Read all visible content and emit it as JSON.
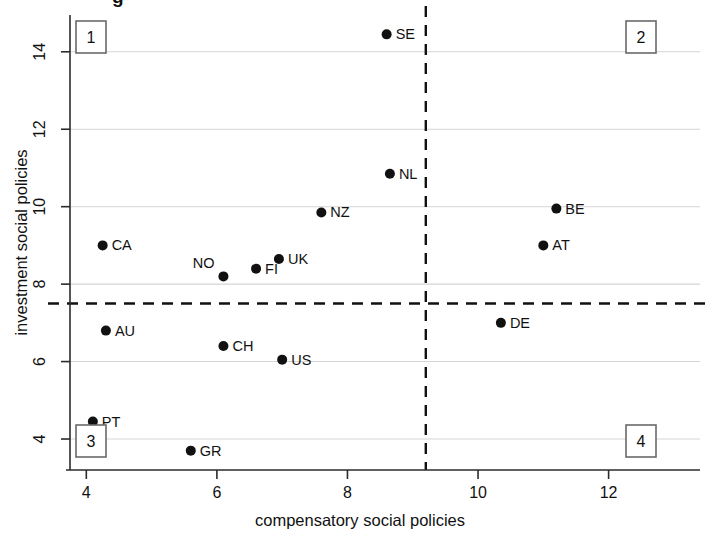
{
  "chart_data": {
    "type": "scatter",
    "title": "",
    "xlabel": "compensatory social policies",
    "ylabel": "investment social policies",
    "xlim": [
      3.75,
      13.4
    ],
    "ylim": [
      3.2,
      14.95
    ],
    "xticks": [
      4,
      6,
      8,
      10,
      12
    ],
    "yticks": [
      4,
      6,
      8,
      10,
      12,
      14
    ],
    "grid": "horizontal-only",
    "legend": "none",
    "reference_lines": [
      {
        "orientation": "vertical",
        "value": 9.2,
        "style": "dashed"
      },
      {
        "orientation": "horizontal",
        "value": 7.5,
        "style": "dashed"
      }
    ],
    "quadrant_labels": [
      {
        "id": "1",
        "corner": "top-left"
      },
      {
        "id": "2",
        "corner": "top-right"
      },
      {
        "id": "3",
        "corner": "bottom-left"
      },
      {
        "id": "4",
        "corner": "bottom-right"
      }
    ],
    "points": [
      {
        "label": "SE",
        "x": 8.6,
        "y": 14.45,
        "label_pos": "right"
      },
      {
        "label": "NL",
        "x": 8.65,
        "y": 10.85,
        "label_pos": "right"
      },
      {
        "label": "BE",
        "x": 11.2,
        "y": 9.95,
        "label_pos": "right"
      },
      {
        "label": "NZ",
        "x": 7.6,
        "y": 9.85,
        "label_pos": "right"
      },
      {
        "label": "AT",
        "x": 11.0,
        "y": 9.0,
        "label_pos": "right"
      },
      {
        "label": "CA",
        "x": 4.25,
        "y": 9.0,
        "label_pos": "right"
      },
      {
        "label": "UK",
        "x": 6.95,
        "y": 8.65,
        "label_pos": "right"
      },
      {
        "label": "FI",
        "x": 6.6,
        "y": 8.4,
        "label_pos": "right"
      },
      {
        "label": "NO",
        "x": 6.1,
        "y": 8.2,
        "label_pos": "upper-left"
      },
      {
        "label": "DE",
        "x": 10.35,
        "y": 7.0,
        "label_pos": "right"
      },
      {
        "label": "AU",
        "x": 4.3,
        "y": 6.8,
        "label_pos": "right"
      },
      {
        "label": "CH",
        "x": 6.1,
        "y": 6.4,
        "label_pos": "right"
      },
      {
        "label": "US",
        "x": 7.0,
        "y": 6.05,
        "label_pos": "right"
      },
      {
        "label": "PT",
        "x": 4.1,
        "y": 4.45,
        "label_pos": "right"
      },
      {
        "label": "GR",
        "x": 5.6,
        "y": 3.7,
        "label_pos": "right"
      }
    ]
  },
  "colors": {
    "point": "#111111",
    "gridline": "#d5d5d5",
    "axis": "#2b2b2b",
    "refline": "#111111",
    "quadrant_box_border": "#6a6a6a",
    "background": "#ffffff"
  },
  "top_cut_text": "g"
}
